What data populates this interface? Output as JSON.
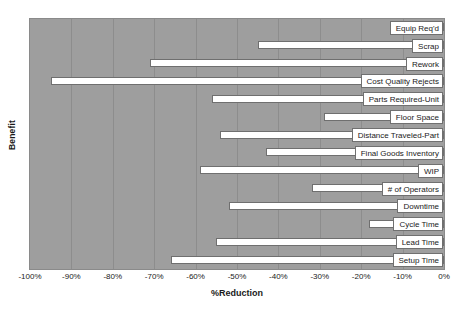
{
  "chart_data": {
    "type": "bar",
    "orientation": "horizontal",
    "title": "",
    "xlabel": "%Reduction",
    "ylabel": "Benefit",
    "xlim": [
      -100,
      0
    ],
    "ylim": null,
    "grid": true,
    "legend": "none",
    "xticks": [
      -100,
      -90,
      -80,
      -70,
      -60,
      -50,
      -40,
      -30,
      -20,
      -10,
      0
    ],
    "xticklabels": [
      "-100%",
      "-90%",
      "-80%",
      "-70%",
      "-60%",
      "-50%",
      "-40%",
      "-30%",
      "-20%",
      "-10%",
      "0%"
    ],
    "categories": [
      "Equip Req'd",
      "Scrap",
      "Rework",
      "Cost Quality Rejects",
      "Parts Required-Unit",
      "Floor Space",
      "Distance Traveled-Part",
      "Final Goods Inventory",
      "WIP",
      "# of Operators",
      "Downtime",
      "Cycle Time",
      "Lead Time",
      "Setup Time"
    ],
    "values": [
      -11,
      -45,
      -71,
      -95,
      -56,
      -29,
      -54,
      -43,
      -59,
      -32,
      -52,
      -18,
      -55,
      -66
    ],
    "colors": {
      "plot_background": "#9e9e9e",
      "bar_fill": "#ffffff",
      "bar_edge": "#6f6f6f",
      "grid": "#8d8d8d",
      "text": "#1a1a1a",
      "page_background": "#ffffff"
    }
  }
}
